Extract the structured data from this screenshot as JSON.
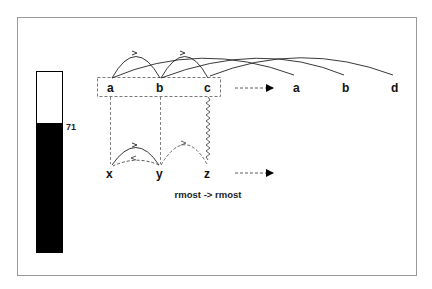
{
  "diagram": {
    "level_bar": {
      "value_label": "71",
      "fill_color": "#000000",
      "empty_color": "#ffffff"
    },
    "top_row": {
      "nodes": [
        "a",
        "b",
        "c"
      ],
      "result_nodes": [
        "a",
        "b",
        "d"
      ]
    },
    "bottom_row": {
      "nodes": [
        "x",
        "y",
        "z"
      ]
    },
    "caption": "rmost -> rmost"
  }
}
